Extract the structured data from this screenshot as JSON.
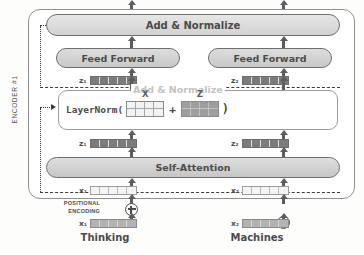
{
  "diagram": {
    "encoder_label": "ENCODER #1"
  },
  "blocks": {
    "add_normalize_top": "Add & Normalize",
    "add_normalize_inner": "Add & Normalize",
    "feed_forward_left": "Feed Forward",
    "feed_forward_right": "Feed Forward",
    "self_attention": "Self-Attention"
  },
  "layernorm": {
    "fn_name": "LayerNorm(",
    "close_paren": ")",
    "operator": "+",
    "matrix_x_label": "X",
    "matrix_z_label": "Z",
    "matrix_rows": 2,
    "matrix_cols": 4
  },
  "vectors": {
    "z1_top": "z₁",
    "z2_top": "z₂",
    "z1_bottom": "z₁",
    "z2_bottom": "z₂",
    "x1_encoder": "x₁",
    "x2_encoder": "x₂",
    "x1_embedding": "x₁",
    "x2_embedding": "x₂",
    "segments": 5
  },
  "positional_encoding": {
    "line1": "POSITIONAL",
    "line2": "ENCODING",
    "operator_icon": "circle-plus-icon"
  },
  "inputs": {
    "word_left": "Thinking",
    "word_right": "Machines"
  },
  "colors": {
    "pill_fill": "#d4d4d4",
    "pill_border": "#6e6e6e",
    "vector_dark": "#7b7b7b",
    "vector_mid": "#b3b3b3",
    "vector_light": "#f4f4f4",
    "arrow": "#5d5d5d",
    "residual_line": "#3c3c3c",
    "text": "#4b4b4b",
    "inner_label_muted": "#c3c3c3"
  }
}
